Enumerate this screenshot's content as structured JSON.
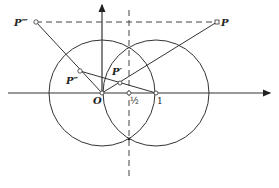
{
  "figure": {
    "stroke_color": "#333333",
    "background": "#ffffff",
    "labels": {
      "P": "P",
      "P_prime": "P′",
      "P_double_prime": "P″",
      "P_triple_prime": "P‴",
      "origin": "O",
      "half": "½",
      "one": "1"
    },
    "points": {
      "O": [
        102,
        93
      ],
      "half": [
        129,
        93
      ],
      "one": [
        156,
        93
      ],
      "P": [
        217,
        22
      ],
      "P_prime": [
        120,
        83
      ],
      "P_double_prime": [
        80,
        71
      ],
      "P_triple_prime": [
        36,
        22
      ],
      "circles_lower_intersection": [
        129,
        139
      ]
    },
    "circles": [
      {
        "name": "circle-centered-O",
        "cx": 102,
        "cy": 93,
        "r": 53
      },
      {
        "name": "circle-centered-1",
        "cx": 156,
        "cy": 93,
        "r": 53
      }
    ]
  }
}
